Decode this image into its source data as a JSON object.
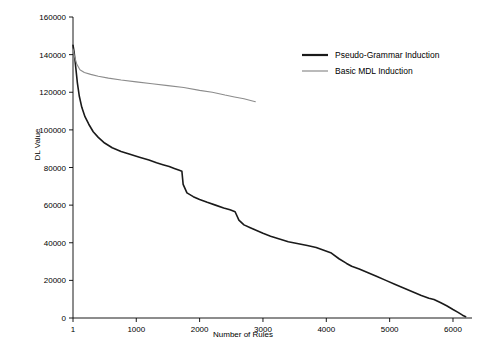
{
  "chart_data": {
    "type": "line",
    "title": "",
    "xlabel": "Number of Rules",
    "ylabel": "DL Value",
    "xlim": [
      1,
      6300
    ],
    "ylim": [
      0,
      160000
    ],
    "xticks": [
      1,
      1000,
      2000,
      3000,
      4000,
      5000,
      6000
    ],
    "xticklabels": [
      "1",
      "1000",
      "2000",
      "3000",
      "4000",
      "5000",
      "6000"
    ],
    "yticks": [
      0,
      20000,
      40000,
      60000,
      80000,
      100000,
      120000,
      140000,
      160000
    ],
    "yticklabels": [
      "0",
      "20000",
      "40000",
      "60000",
      "80000",
      "100000",
      "120000",
      "140000",
      "160000"
    ],
    "grid": false,
    "legend_position": "upper-right",
    "series": [
      {
        "name": "Pseudo-Grammar Induction",
        "color": "#1a1a1a",
        "width": 1.6,
        "points": [
          [
            1,
            145000
          ],
          [
            20,
            141000
          ],
          [
            45,
            133000
          ],
          [
            70,
            125000
          ],
          [
            100,
            118000
          ],
          [
            140,
            112000
          ],
          [
            190,
            107000
          ],
          [
            250,
            103000
          ],
          [
            320,
            99000
          ],
          [
            400,
            96000
          ],
          [
            500,
            93000
          ],
          [
            620,
            90500
          ],
          [
            760,
            88500
          ],
          [
            900,
            87000
          ],
          [
            1050,
            85500
          ],
          [
            1200,
            84000
          ],
          [
            1320,
            82500
          ],
          [
            1420,
            81500
          ],
          [
            1520,
            80500
          ],
          [
            1600,
            79500
          ],
          [
            1680,
            78500
          ],
          [
            1720,
            78000
          ],
          [
            1740,
            71000
          ],
          [
            1800,
            66500
          ],
          [
            1900,
            64500
          ],
          [
            2000,
            63000
          ],
          [
            2120,
            61500
          ],
          [
            2250,
            60000
          ],
          [
            2380,
            58500
          ],
          [
            2480,
            57500
          ],
          [
            2560,
            56500
          ],
          [
            2620,
            52000
          ],
          [
            2700,
            49500
          ],
          [
            2800,
            48000
          ],
          [
            2900,
            46500
          ],
          [
            3000,
            45000
          ],
          [
            3120,
            43500
          ],
          [
            3260,
            42000
          ],
          [
            3400,
            40500
          ],
          [
            3560,
            39500
          ],
          [
            3700,
            38500
          ],
          [
            3840,
            37500
          ],
          [
            3960,
            36000
          ],
          [
            4080,
            34500
          ],
          [
            4200,
            31500
          ],
          [
            4320,
            29000
          ],
          [
            4400,
            27500
          ],
          [
            4520,
            26000
          ],
          [
            4660,
            24000
          ],
          [
            4800,
            22000
          ],
          [
            4940,
            20000
          ],
          [
            5080,
            18000
          ],
          [
            5220,
            16000
          ],
          [
            5360,
            14000
          ],
          [
            5500,
            12000
          ],
          [
            5620,
            10500
          ],
          [
            5700,
            9800
          ],
          [
            5800,
            8200
          ],
          [
            5900,
            6500
          ],
          [
            6000,
            4500
          ],
          [
            6080,
            3000
          ],
          [
            6150,
            1500
          ],
          [
            6200,
            700
          ]
        ]
      },
      {
        "name": "Basic MDL Induction",
        "color": "#8c8c8c",
        "width": 1.1,
        "points": [
          [
            1,
            143000
          ],
          [
            25,
            139000
          ],
          [
            60,
            135000
          ],
          [
            110,
            132000
          ],
          [
            180,
            130500
          ],
          [
            280,
            129500
          ],
          [
            400,
            128500
          ],
          [
            560,
            127500
          ],
          [
            760,
            126500
          ],
          [
            1000,
            125500
          ],
          [
            1250,
            124500
          ],
          [
            1500,
            123500
          ],
          [
            1750,
            122500
          ],
          [
            2000,
            121000
          ],
          [
            2200,
            120000
          ],
          [
            2400,
            118500
          ],
          [
            2550,
            117500
          ],
          [
            2700,
            116500
          ],
          [
            2820,
            115500
          ],
          [
            2880,
            115000
          ]
        ]
      }
    ],
    "legend": [
      {
        "label": "Pseudo-Grammar Induction",
        "color": "#1a1a1a",
        "width": 2.2
      },
      {
        "label": "Basic MDL Induction",
        "color": "#8c8c8c",
        "width": 1.2
      }
    ]
  }
}
